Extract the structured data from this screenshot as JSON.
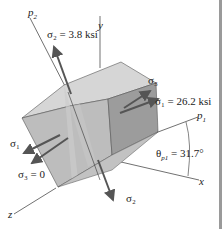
{
  "diagram": {
    "type": "stress-element-3d",
    "colors": {
      "top_face": "#d6d6d6",
      "left_face": "#bdbdbd",
      "right_face": "#9c9c9c",
      "band": "#c8c8c8",
      "arrow": "#555555",
      "line": "#333333",
      "border": "#9a9a9a"
    },
    "axes": {
      "p2": "p",
      "p2_sub": "2",
      "y": "y",
      "p1": "p",
      "p1_sub": "1",
      "x": "x",
      "z": "z"
    },
    "labels": {
      "sigma2_top": "σ₂ = 3.8 ksi",
      "sigma3_right": "σ₃",
      "sigma1_right": "σ₁ = 26.2 ksi",
      "sigma1_left": "σ₁",
      "sigma3_left": "σ₃ = 0",
      "sigma2_bottom": "σ₂",
      "theta": "θ",
      "theta_sub": "p1",
      "theta_value": "= 31.7°"
    }
  }
}
